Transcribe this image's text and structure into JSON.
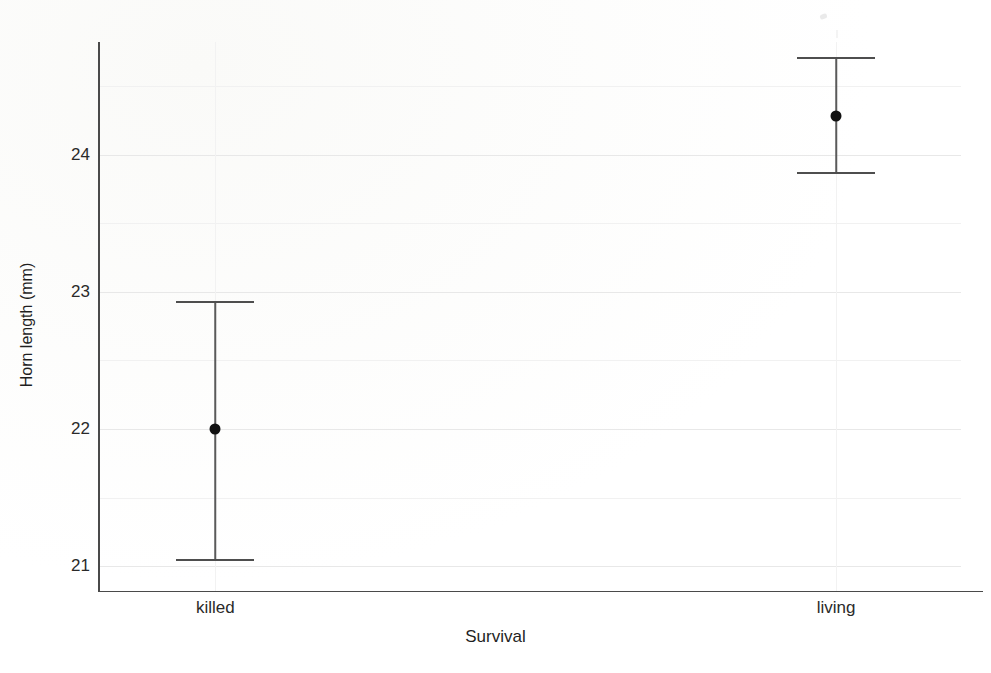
{
  "chart_data": {
    "type": "scatter",
    "title": "",
    "xlabel": "Survival",
    "ylabel": "Horn length (mm)",
    "categories": [
      "killed",
      "living"
    ],
    "series": [
      {
        "name": "mean horn length",
        "values": [
          22.0,
          24.28
        ]
      }
    ],
    "error_bars": {
      "lower": [
        21.05,
        23.87
      ],
      "upper": [
        22.93,
        24.71
      ]
    },
    "points": [
      {
        "category": "killed",
        "mean": 22.0,
        "lower": 21.05,
        "upper": 22.93
      },
      {
        "category": "living",
        "mean": 24.28,
        "lower": 23.87,
        "upper": 24.71
      }
    ],
    "ylim": [
      20.82,
      24.82
    ],
    "xlim": [
      0,
      1
    ],
    "yticks": [
      21,
      22,
      23,
      24
    ],
    "ytick_labels": [
      "21",
      "22",
      "23",
      "24"
    ],
    "yminor_ticks": [
      21.5,
      22.5,
      23.5,
      24.5
    ],
    "xtick_positions": [
      0.135,
      0.855
    ],
    "grid": true,
    "grid_axis": "both",
    "legend": null,
    "marker": "filled-circle",
    "marker_color": "#111111",
    "errorbar_color": "#4e4e4e",
    "gridline_color": "#e8e8e8",
    "axis_color": "#4a4a4a"
  },
  "axes": {
    "y_label": "Horn length (mm)",
    "x_label": "Survival",
    "y_tick_labels": [
      "24",
      "23",
      "22",
      "21"
    ],
    "x_tick_labels": [
      "killed",
      "living"
    ]
  },
  "figure": {
    "background_color": "#fefefe",
    "width": 991,
    "height": 673
  }
}
